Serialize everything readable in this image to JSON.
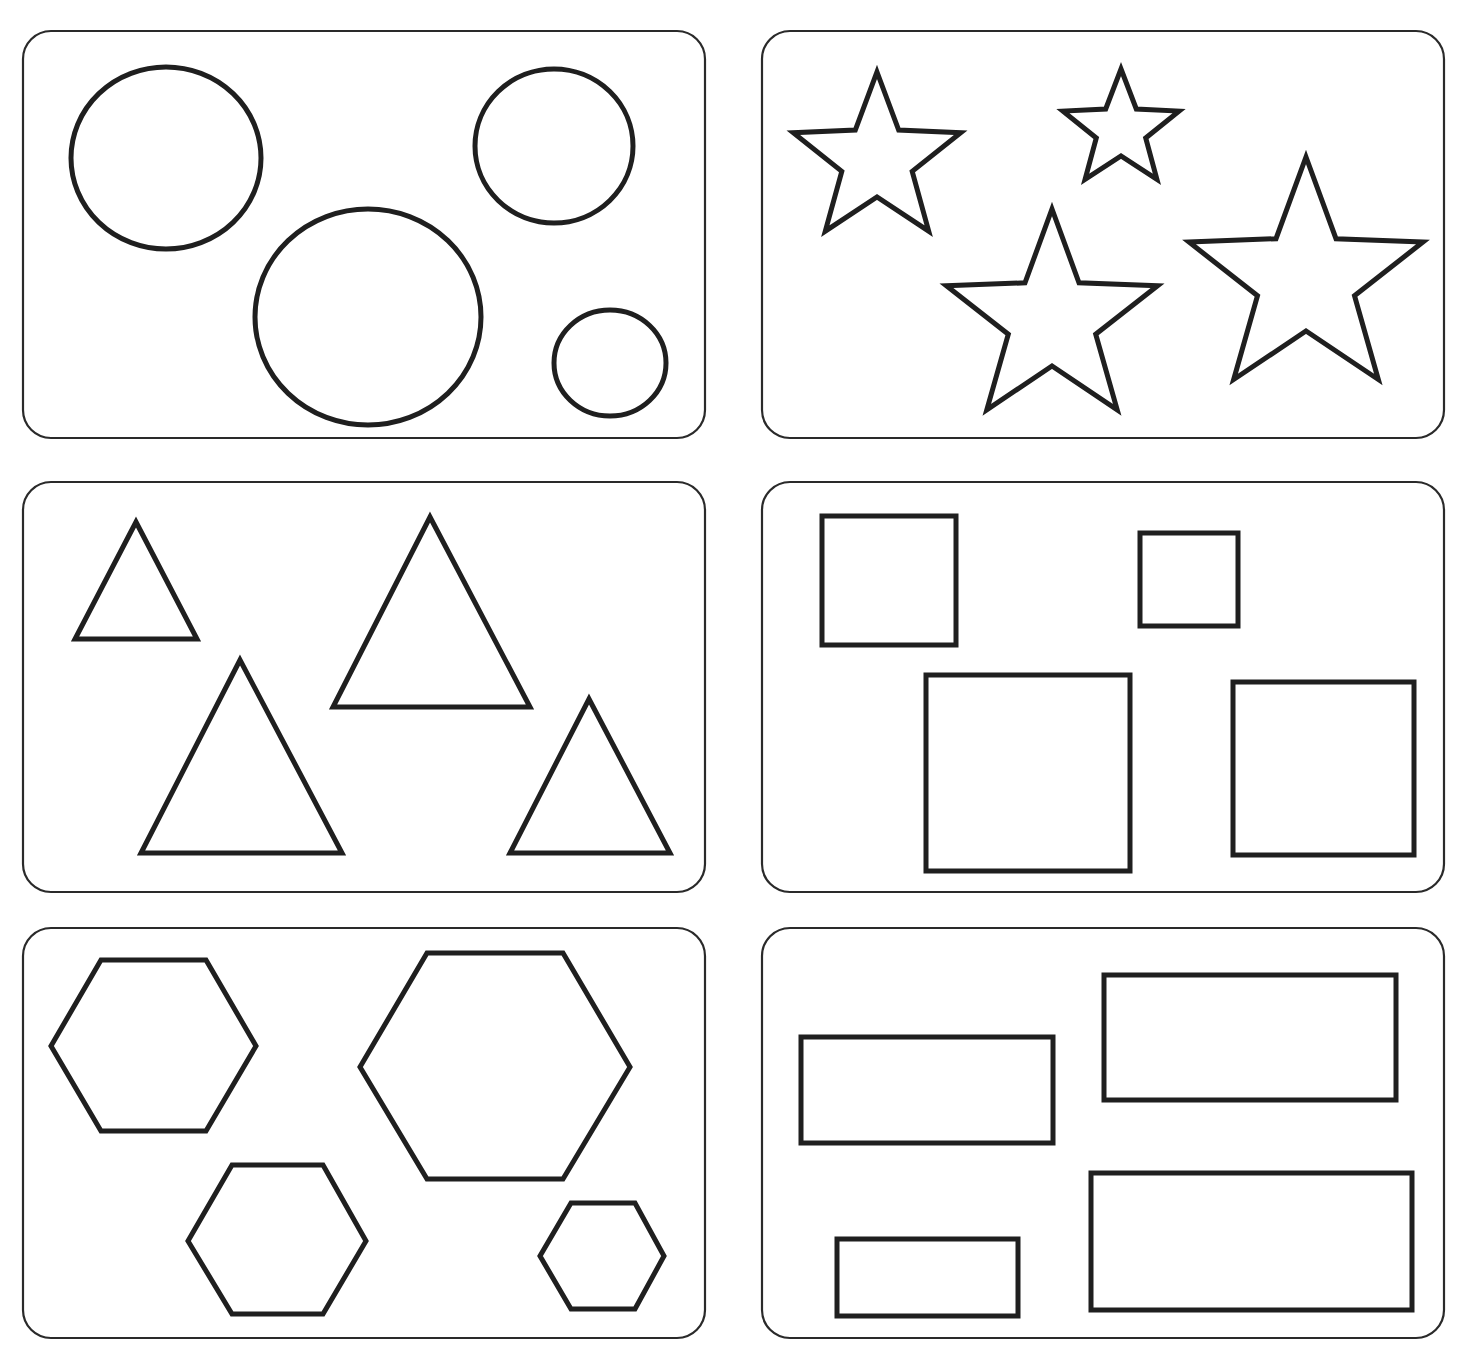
{
  "worksheet": {
    "stroke_color": "#1f1f1f",
    "background": "#ffffff",
    "panels": [
      {
        "name": "circles",
        "shape_type": "circle",
        "count": 4,
        "box": [
          23,
          31,
          682,
          407
        ],
        "shapes": [
          {
            "cx": 166,
            "cy": 158,
            "rx": 95,
            "ry": 91
          },
          {
            "cx": 554,
            "cy": 146,
            "rx": 79,
            "ry": 77
          },
          {
            "cx": 368,
            "cy": 317,
            "rx": 113,
            "ry": 108
          },
          {
            "cx": 610,
            "cy": 363,
            "rx": 56,
            "ry": 53
          }
        ]
      },
      {
        "name": "stars",
        "shape_type": "star",
        "count": 4,
        "box": [
          762,
          31,
          682,
          407
        ],
        "shapes": [
          {
            "cx": 877,
            "cy": 160,
            "outer": 88,
            "inner": 37
          },
          {
            "cx": 1121,
            "cy": 130,
            "outer": 61,
            "inner": 26
          },
          {
            "cx": 1052,
            "cy": 320,
            "outer": 111,
            "inner": 46
          },
          {
            "cx": 1306,
            "cy": 280,
            "outer": 123,
            "inner": 51
          }
        ]
      },
      {
        "name": "triangles",
        "shape_type": "triangle",
        "count": 4,
        "box": [
          23,
          482,
          682,
          410
        ],
        "shapes": [
          {
            "points": "136,522 197,639 75,639"
          },
          {
            "points": "430,517 530,707 333,707"
          },
          {
            "points": "240,660 342,853 141,853"
          },
          {
            "points": "589,699 670,853 510,853"
          }
        ]
      },
      {
        "name": "squares",
        "shape_type": "square",
        "count": 4,
        "box": [
          762,
          482,
          682,
          410
        ],
        "shapes": [
          {
            "x": 822,
            "y": 516,
            "w": 134,
            "h": 129
          },
          {
            "x": 1140,
            "y": 533,
            "w": 98,
            "h": 93
          },
          {
            "x": 926,
            "y": 675,
            "w": 204,
            "h": 196
          },
          {
            "x": 1233,
            "y": 682,
            "w": 181,
            "h": 173
          }
        ]
      },
      {
        "name": "hexagons",
        "shape_type": "hexagon",
        "count": 4,
        "box": [
          23,
          928,
          682,
          410
        ],
        "shapes": [
          {
            "points": "101,960 206,960 256,1046 206,1131 101,1131 51,1046"
          },
          {
            "points": "427,953 563,953 630,1067 563,1179 427,1179 360,1067"
          },
          {
            "points": "232,1165 323,1165 366,1241 323,1314 232,1314 188,1241"
          },
          {
            "points": "571,1203 635,1203 664,1256 635,1309 571,1309 540,1256"
          }
        ]
      },
      {
        "name": "rectangles",
        "shape_type": "rectangle",
        "count": 4,
        "box": [
          762,
          928,
          682,
          410
        ],
        "shapes": [
          {
            "x": 801,
            "y": 1037,
            "w": 252,
            "h": 106
          },
          {
            "x": 1104,
            "y": 975,
            "w": 292,
            "h": 125
          },
          {
            "x": 837,
            "y": 1239,
            "w": 181,
            "h": 77
          },
          {
            "x": 1091,
            "y": 1173,
            "w": 321,
            "h": 137
          }
        ]
      }
    ]
  }
}
